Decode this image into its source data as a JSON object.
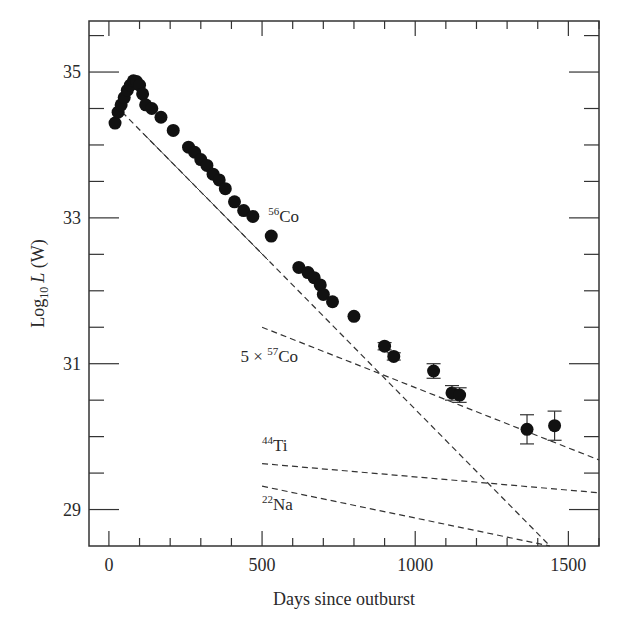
{
  "chart_data": {
    "type": "scatter",
    "title": "",
    "xlabel": "Days since outburst",
    "ylabel": "Log10 L (W)",
    "ylabel_parts": {
      "prefix": "Log",
      "sub": "10",
      "var": "L",
      "unit": " (W)"
    },
    "xlim": [
      -65,
      1600
    ],
    "ylim": [
      28.5,
      35.7
    ],
    "x_ticks": [
      0,
      500,
      1000,
      1500
    ],
    "x_tick_labels": [
      "0",
      "500",
      "1000",
      "1500"
    ],
    "x_minor_step": 100,
    "y_ticks": [
      29,
      31,
      33,
      35
    ],
    "y_tick_labels": [
      "29",
      "31",
      "33",
      "35"
    ],
    "y_minor_step": 0.5,
    "grid": false,
    "legend": null,
    "series": [
      {
        "name": "Observed bolometric luminosity",
        "kind": "points",
        "color": "#111111",
        "points": [
          [
            20,
            34.3
          ],
          [
            30,
            34.45
          ],
          [
            40,
            34.55
          ],
          [
            50,
            34.65
          ],
          [
            60,
            34.75
          ],
          [
            70,
            34.82
          ],
          [
            80,
            34.88
          ],
          [
            90,
            34.87
          ],
          [
            100,
            34.82
          ],
          [
            110,
            34.7
          ],
          [
            120,
            34.55
          ],
          [
            140,
            34.5
          ],
          [
            170,
            34.38
          ],
          [
            210,
            34.2
          ],
          [
            260,
            33.97
          ],
          [
            280,
            33.9
          ],
          [
            300,
            33.8
          ],
          [
            320,
            33.72
          ],
          [
            340,
            33.6
          ],
          [
            360,
            33.52
          ],
          [
            380,
            33.4
          ],
          [
            410,
            33.22
          ],
          [
            440,
            33.1
          ],
          [
            470,
            33.02
          ],
          [
            530,
            32.75
          ],
          [
            620,
            32.32
          ],
          [
            650,
            32.25
          ],
          [
            670,
            32.18
          ],
          [
            690,
            32.08
          ],
          [
            700,
            31.95
          ],
          [
            730,
            31.85
          ],
          [
            800,
            31.65
          ]
        ]
      },
      {
        "name": "Late-time points with error bars",
        "kind": "errorbar",
        "color": "#111111",
        "points": [
          [
            900,
            31.24,
            0.05
          ],
          [
            930,
            31.1,
            0.05
          ],
          [
            1060,
            30.9,
            0.1
          ],
          [
            1120,
            30.6,
            0.1
          ],
          [
            1145,
            30.57,
            0.1
          ],
          [
            1365,
            30.1,
            0.2
          ],
          [
            1455,
            30.15,
            0.2
          ]
        ]
      },
      {
        "name": "56Co",
        "kind": "dashed-line",
        "points": [
          [
            20,
            34.55
          ],
          [
            1440,
            28.5
          ]
        ]
      },
      {
        "name": "5 x 57Co",
        "kind": "dashed-line",
        "points": [
          [
            500,
            31.5
          ],
          [
            1600,
            29.68
          ]
        ]
      },
      {
        "name": "44Ti",
        "kind": "dashed-line",
        "points": [
          [
            500,
            29.63
          ],
          [
            1600,
            29.23
          ]
        ]
      },
      {
        "name": "22Na",
        "kind": "dashed-line",
        "points": [
          [
            500,
            29.32
          ],
          [
            1440,
            28.5
          ]
        ]
      }
    ],
    "annotations": [
      {
        "sup": "56",
        "text": "Co",
        "prefix": "",
        "x": 520,
        "y": 32.95
      },
      {
        "sup": "57",
        "text": "Co",
        "prefix": "5 × ",
        "x": 430,
        "y": 31.03
      },
      {
        "sup": "44",
        "text": "Ti",
        "prefix": "",
        "x": 500,
        "y": 29.8
      },
      {
        "sup": "22",
        "text": "Na",
        "prefix": "",
        "x": 500,
        "y": 29.0
      }
    ]
  }
}
